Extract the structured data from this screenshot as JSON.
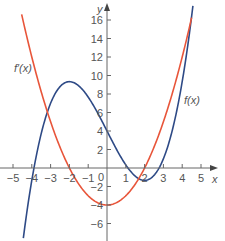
{
  "chart_data": {
    "type": "line",
    "title": "",
    "xlabel": "x",
    "ylabel": "y",
    "xlim": [
      -5.5,
      5.5
    ],
    "ylim": [
      -7,
      17.5
    ],
    "grid": false,
    "x_ticks": [
      -5,
      -4,
      -3,
      -2,
      -1,
      0,
      1,
      2,
      3,
      4,
      5
    ],
    "x_tick_labels": [
      "−5",
      "−4",
      "−3",
      "−2",
      "−1",
      "0",
      "1",
      "2",
      "3",
      "4",
      "5"
    ],
    "y_ticks": [
      -6,
      -4,
      -2,
      2,
      4,
      6,
      8,
      10,
      12,
      14,
      16
    ],
    "y_tick_labels": [
      "−6",
      "−4",
      "−2",
      "2",
      "4",
      "6",
      "8",
      "10",
      "12",
      "14",
      "16"
    ],
    "series": [
      {
        "name": "f(x)",
        "label": "f(x)",
        "color": "#2e4a86",
        "formula": "x^3/3 - 4x + 4",
        "x": [
          -4.45,
          -4,
          -3.5,
          -3,
          -2.5,
          -2,
          -1.5,
          -1,
          -0.5,
          0,
          0.5,
          1,
          1.5,
          2,
          2.5,
          3,
          3.5,
          4,
          4.57
        ],
        "y": [
          -7.6,
          -1.33,
          3.71,
          7,
          8.79,
          9.33,
          8.88,
          7.67,
          5.96,
          4,
          2.04,
          0.33,
          -0.88,
          -1.33,
          -0.79,
          1,
          4.29,
          9.33,
          17.5
        ]
      },
      {
        "name": "f′(x)",
        "label": "f′(x)",
        "color": "#e8553a",
        "formula": "x^2 - 4",
        "x": [
          -4.54,
          -4,
          -3.5,
          -3,
          -2.5,
          -2,
          -1.5,
          -1,
          -0.5,
          0,
          0.5,
          1,
          1.5,
          2,
          2.5,
          3,
          3.5,
          4,
          4.5
        ],
        "y": [
          16.6,
          12,
          8.25,
          5,
          2.25,
          0,
          -1.75,
          -3,
          -3.75,
          -4,
          -3.75,
          -3,
          -1.75,
          0,
          2.25,
          5,
          8.25,
          12,
          16.25
        ]
      }
    ],
    "annotations": [
      {
        "text": "f′(x)",
        "x": -5.1,
        "y": 10.6
      },
      {
        "text": "f(x)",
        "x": 4.1,
        "y": 7.3
      }
    ]
  },
  "labels": {
    "x_axis": "x",
    "y_axis": "y",
    "origin": "0",
    "f_label": "f(x)",
    "fprime_label": "f′(x)"
  }
}
